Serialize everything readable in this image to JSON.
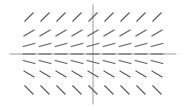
{
  "chart_data": {
    "type": "slope_field",
    "title": "",
    "xlabel": "",
    "ylabel": "",
    "grid": false,
    "columns_x": [
      29,
      45,
      61,
      77,
      93,
      109,
      125,
      141,
      157
    ],
    "rows": [
      {
        "y": 17,
        "slope": 1.0
      },
      {
        "y": 33,
        "slope": 0.6
      },
      {
        "y": 45,
        "slope": 0.25
      },
      {
        "y": 54,
        "slope": 0.0
      },
      {
        "y": 62,
        "slope": -0.25
      },
      {
        "y": 74,
        "slope": -0.6
      },
      {
        "y": 90,
        "slope": -1.0
      }
    ],
    "segment_length": 12,
    "axes": {
      "x_axis": {
        "y": 54,
        "x_from": 10,
        "x_to": 176
      },
      "y_axis": {
        "x": 93,
        "y_from": 5,
        "y_to": 104
      }
    }
  },
  "colors": {
    "background": "#ffffff",
    "axis": "#9a9a9a",
    "segment": "#5a5a5a"
  }
}
